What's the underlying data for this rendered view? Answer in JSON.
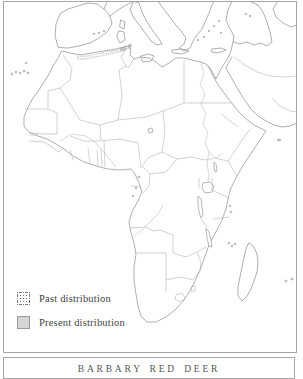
{
  "figure": {
    "type": "species-distribution-map",
    "region": "Africa, Mediterranean Europe and Arabia",
    "caption": "BARBARY RED DEER",
    "legend": {
      "items": [
        {
          "id": "past",
          "label": "Past distribution",
          "swatch": "stippled-dots"
        },
        {
          "id": "present",
          "label": "Present distribution",
          "swatch": "solid-gray"
        }
      ]
    },
    "distribution_note": "Stippled past-distribution band along the Maghreb coast of Algeria and Tunisia with small present-distribution patches near the Algeria-Tunisia border",
    "colors": {
      "background": "#ffffff",
      "frame": "#a6a6a6",
      "coastline": "#9a9a9a",
      "border_line": "#b4b4b4",
      "river_line": "#b0b0b0",
      "stipple_dot": "#777777",
      "present_fill": "#c9c9c9",
      "legend_text": "#3f3f3f",
      "caption_text": "#555555"
    }
  }
}
